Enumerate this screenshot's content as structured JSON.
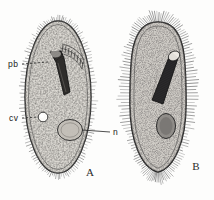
{
  "figure": {
    "kind": "scientific-illustration",
    "background_color": "#fdfdfc",
    "ink_color": "#1a1a1a"
  },
  "panels": [
    {
      "id": "A",
      "label": "A",
      "label_x": 90,
      "label_y": 176,
      "body": {
        "center_x": 58,
        "center_y": 97,
        "rx": 33,
        "ry": 76,
        "outline_color": "#2a2a2a",
        "fill_color": "#d8d5cf",
        "cilia_style": "short-fine",
        "cilia_count": 132,
        "cilia_length": 5
      },
      "organelles": [
        {
          "name": "peristome-cytopharynx",
          "shape": "funnel",
          "x": 55,
          "y": 60,
          "color": "#2f2d2b"
        },
        {
          "name": "contractile-vacuole",
          "shape": "circle",
          "x": 43,
          "y": 117,
          "r": 4.6,
          "color": "#ffffff"
        },
        {
          "name": "macronucleus",
          "shape": "oval",
          "x": 70,
          "y": 130,
          "rx": 12,
          "ry": 10,
          "color": "#b9b5ae"
        }
      ]
    },
    {
      "id": "B",
      "label": "B",
      "label_x": 196,
      "label_y": 170,
      "body": {
        "center_x": 158,
        "center_y": 96,
        "rx": 28,
        "ry": 74,
        "outline_color": "#232323",
        "fill_color": "#cfccc6",
        "cilia_style": "long-radiating",
        "cilia_count": 150,
        "cilia_length": 11
      },
      "organelles": [
        {
          "name": "peristome-cytopharynx",
          "shape": "elongate-hatched",
          "x": 162,
          "y": 72,
          "color": "#29282a"
        },
        {
          "name": "macronucleus",
          "shape": "oval",
          "x": 166,
          "y": 126,
          "rx": 9,
          "ry": 12,
          "color": "#8f8c88"
        }
      ]
    }
  ],
  "annotations": [
    {
      "key": "pb",
      "text": "pb",
      "text_x": 8,
      "text_y": 67,
      "leader_from_x": 22,
      "leader_from_y": 64,
      "leader_to_x": 48,
      "leader_to_y": 62,
      "dashed": true,
      "points_to": "peristome-cytopharynx"
    },
    {
      "key": "cv",
      "text": "cv",
      "text_x": 9,
      "text_y": 121,
      "leader_from_x": 22,
      "leader_from_y": 118,
      "leader_to_x": 39,
      "leader_to_y": 117,
      "dashed": true,
      "points_to": "contractile-vacuole"
    },
    {
      "key": "n",
      "text": "n",
      "text_x": 113,
      "text_y": 135,
      "leader_from_x": 111,
      "leader_from_y": 132,
      "leader_to_x": 82,
      "leader_to_y": 130,
      "dashed": false,
      "points_to": "macronucleus"
    }
  ]
}
